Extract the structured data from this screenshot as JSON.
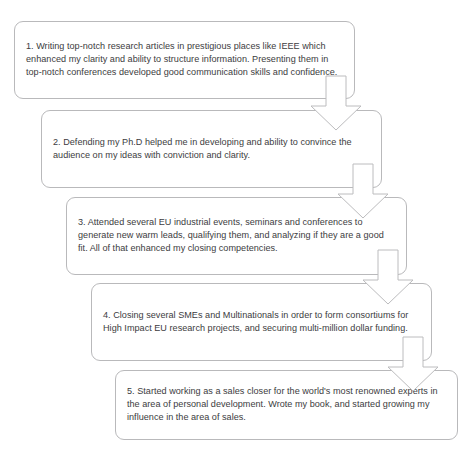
{
  "diagram": {
    "type": "cascading-staircase-flowchart",
    "orientation": "top-left to bottom-right",
    "background_color": "#ffffff",
    "box_border_color": "#b9b9bb",
    "text_color": "#3c3c3e",
    "arrow_fill_color": "#ffffff",
    "arrow_stroke_color": "#bcbcbe",
    "steps": [
      {
        "number": "1",
        "text": "1. Writing top-notch research articles in prestigious places like IEEE which enhanced my clarity and ability to structure information. Presenting them in top-notch conferences developed good communication skills and confidence.",
        "x": 14,
        "y": 21,
        "width": 341,
        "height": 78
      },
      {
        "number": "2",
        "text": "2. Defending my Ph.D helped me in developing and ability to convince the audience on my ideas with conviction and clarity.",
        "x": 41,
        "y": 110,
        "width": 341,
        "height": 78
      },
      {
        "number": "3",
        "text": "3. Attended several EU industrial events, seminars and conferences to generate new warm leads, qualifying them, and analyzing if they are a good fit. All of that enhanced my closing competencies.",
        "x": 66,
        "y": 197,
        "width": 341,
        "height": 78
      },
      {
        "number": "4",
        "text": "4. Closing several SMEs and Multinationals in order to form consortiums for High Impact EU research projects, and securing multi-million dollar funding.",
        "x": 91,
        "y": 283,
        "width": 341,
        "height": 78
      },
      {
        "number": "5",
        "text": "5. Started working as a sales closer for the world's most renowned experts in the area of personal development. Wrote my book, and started growing my influence in the area of sales.",
        "x": 115,
        "y": 370,
        "width": 343,
        "height": 70
      }
    ],
    "arrows": [
      {
        "label": "arrow-step-1-to-step-2",
        "x": 310,
        "y": 76,
        "width": 52,
        "height": 55
      },
      {
        "label": "arrow-step-2-to-step-3",
        "x": 337,
        "y": 164,
        "width": 52,
        "height": 55
      },
      {
        "label": "arrow-step-3-to-step-4",
        "x": 362,
        "y": 250,
        "width": 52,
        "height": 55
      },
      {
        "label": "arrow-step-4-to-step-5",
        "x": 387,
        "y": 337,
        "width": 52,
        "height": 55
      }
    ]
  }
}
